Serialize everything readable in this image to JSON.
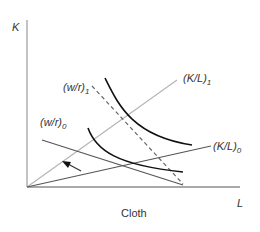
{
  "diagram": {
    "title": "",
    "y_axis_label": "K",
    "x_axis_label": "L",
    "caption": "Cloth",
    "rays": [
      {
        "name": "K/L",
        "subscript": "1",
        "color": "#b5b5b5"
      },
      {
        "name": "K/L",
        "subscript": "0",
        "color": "#555555"
      }
    ],
    "price_lines": [
      {
        "name": "w/r",
        "subscript": "1",
        "style": "dashed",
        "color": "#666666"
      },
      {
        "name": "w/r",
        "subscript": "0",
        "style": "solid",
        "color": "#555555"
      }
    ],
    "isoquants": [
      {
        "name": "isoquant-high",
        "color": "#111111"
      },
      {
        "name": "isoquant-low",
        "color": "#111111"
      }
    ],
    "arrow": {
      "direction": "up-left",
      "meaning": "rotation from (K/L)0 toward (K/L)1"
    },
    "colors": {
      "axis_y": "#9a9a9a",
      "axis_x": "#555555",
      "text": "#333333"
    }
  }
}
